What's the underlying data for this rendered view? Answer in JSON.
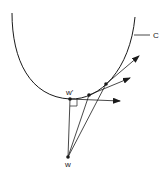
{
  "diagram": {
    "curve_label": "C",
    "point_w_label": "w",
    "point_w_prime_label": "w'",
    "colors": {
      "stroke": "#1a1a1a",
      "background": "#ffffff"
    },
    "points": {
      "w": [
        68,
        157
      ],
      "w_prime": [
        70,
        99
      ],
      "p2": [
        89,
        95
      ],
      "p3": [
        106,
        84
      ]
    }
  }
}
